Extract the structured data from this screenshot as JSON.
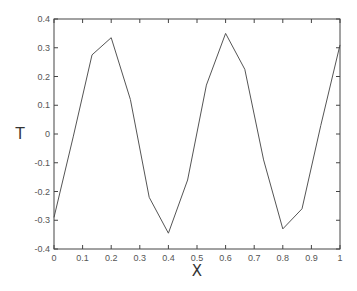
{
  "chart_data": {
    "type": "line",
    "title": "",
    "xlabel": "X",
    "ylabel": "T",
    "xlim": [
      0,
      1
    ],
    "ylim": [
      -0.4,
      0.4
    ],
    "grid": false,
    "legend": null,
    "x_ticks": [
      "0",
      "0.1",
      "0.2",
      "0.3",
      "0.4",
      "0.5",
      "0.6",
      "0.7",
      "0.8",
      "0.9",
      "1"
    ],
    "y_ticks": [
      "-0.4",
      "-0.3",
      "-0.2",
      "-0.1",
      "0",
      "0.1",
      "0.2",
      "0.3",
      "0.4"
    ],
    "series": [
      {
        "name": "T",
        "color": "#555555",
        "x": [
          0,
          0.067,
          0.133,
          0.2,
          0.267,
          0.333,
          0.4,
          0.467,
          0.533,
          0.6,
          0.667,
          0.733,
          0.8,
          0.867,
          0.933,
          1.0
        ],
        "y": [
          -0.29,
          -0.01,
          0.275,
          0.335,
          0.12,
          -0.22,
          -0.345,
          -0.16,
          0.17,
          0.35,
          0.225,
          -0.09,
          -0.33,
          -0.26,
          0.03,
          0.31
        ]
      }
    ]
  },
  "colors": {
    "axis": "#444444",
    "line": "#555555",
    "background": "#ffffff"
  }
}
